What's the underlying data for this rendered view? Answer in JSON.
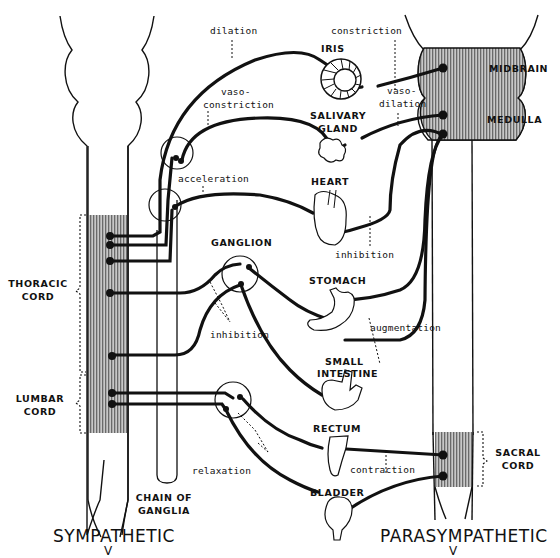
{
  "diagram": {
    "title_left": "SYMPATHETIC",
    "title_right": "PARASYMPATHETIC",
    "colors": {
      "ink": "#111111",
      "cord_shade": "#9a9a9a",
      "background": "#ffffff"
    },
    "cord_regions": {
      "thoracic": [
        "THORACIC",
        "CORD"
      ],
      "lumbar": [
        "LUMBAR",
        "CORD"
      ],
      "midbrain": "MIDBRAIN",
      "medulla": "MEDULLA",
      "sacral": [
        "SACRAL",
        "CORD"
      ],
      "chain_of_ganglia": [
        "CHAIN OF",
        "GANGLIA"
      ]
    },
    "organs": {
      "iris": "IRIS",
      "salivary_gland": [
        "SALIVARY",
        "GLAND"
      ],
      "heart": "HEART",
      "ganglion": "GANGLION",
      "stomach": "STOMACH",
      "small_intestine": [
        "SMALL",
        "INTESTINE"
      ],
      "rectum": "RECTUM",
      "bladder": "BLADDER"
    },
    "effects": {
      "dilation": "dilation",
      "constriction": "constriction",
      "vasoconstriction": [
        "vaso-",
        "constriction"
      ],
      "vasodilation": [
        "vaso-",
        "dilation"
      ],
      "acceleration": "acceleration",
      "heart_inhibition": "inhibition",
      "gut_inhibition": "inhibition",
      "augmentation": "augmentation",
      "relaxation": "relaxation",
      "contraction": "contraction"
    }
  }
}
